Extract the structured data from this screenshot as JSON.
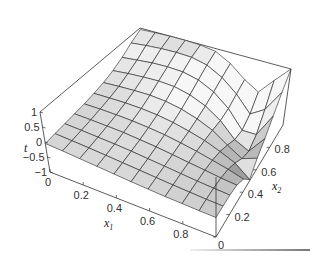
{
  "chart_data": {
    "type": "surface",
    "title": "",
    "xlabel": "x",
    "xlabel_sub": "1",
    "ylabel": "x",
    "ylabel_sub": "2",
    "zlabel": "t",
    "xlim": [
      0,
      1
    ],
    "ylim": [
      0,
      1
    ],
    "zlim": [
      -1,
      1
    ],
    "x_ticks": [
      "0",
      "0.2",
      "0.4",
      "0.6",
      "0.8"
    ],
    "x_tick_values": [
      0,
      0.2,
      0.4,
      0.6,
      0.8
    ],
    "y_ticks": [
      "0",
      "0.2",
      "0.4",
      "0.6",
      "0.8"
    ],
    "y_tick_values": [
      0,
      0.2,
      0.4,
      0.6,
      0.8
    ],
    "z_ticks": [
      "1",
      "0.5",
      "0",
      "−0.5",
      "−1"
    ],
    "z_tick_values": [
      1,
      0.5,
      0,
      -0.5,
      -1
    ],
    "grid_x": [
      0,
      0.1,
      0.2,
      0.3,
      0.4,
      0.5,
      0.6,
      0.7,
      0.8,
      0.9,
      1.0
    ],
    "grid_y": [
      0,
      0.1,
      0.2,
      0.3,
      0.4,
      0.5,
      0.6,
      0.7,
      0.8,
      0.9,
      1.0
    ],
    "z_values": [
      [
        -0.05,
        0.0,
        0.05,
        0.1,
        0.15,
        0.22,
        0.3,
        0.42,
        0.58,
        0.78,
        0.95
      ],
      [
        -0.08,
        -0.03,
        0.03,
        0.09,
        0.16,
        0.24,
        0.34,
        0.48,
        0.64,
        0.84,
        0.98
      ],
      [
        -0.12,
        -0.06,
        0.0,
        0.07,
        0.15,
        0.25,
        0.37,
        0.52,
        0.7,
        0.88,
        1.0
      ],
      [
        -0.16,
        -0.1,
        -0.03,
        0.05,
        0.13,
        0.24,
        0.38,
        0.55,
        0.72,
        0.9,
        1.0
      ],
      [
        -0.2,
        -0.14,
        -0.07,
        0.0,
        0.09,
        0.2,
        0.34,
        0.52,
        0.7,
        0.88,
        0.98
      ],
      [
        -0.24,
        -0.18,
        -0.12,
        -0.05,
        0.03,
        0.12,
        0.24,
        0.4,
        0.58,
        0.76,
        0.9
      ],
      [
        -0.27,
        -0.22,
        -0.17,
        -0.12,
        -0.06,
        0.0,
        0.08,
        0.18,
        0.32,
        0.48,
        0.62
      ],
      [
        -0.3,
        -0.26,
        -0.22,
        -0.19,
        -0.16,
        -0.14,
        -0.14,
        -0.16,
        -0.1,
        0.05,
        0.2
      ],
      [
        -0.32,
        -0.29,
        -0.27,
        -0.26,
        -0.28,
        -0.34,
        -0.48,
        -0.66,
        -0.7,
        -0.5,
        -0.1
      ],
      [
        -0.34,
        -0.32,
        -0.31,
        -0.33,
        -0.4,
        -0.56,
        -0.78,
        -0.9,
        -0.7,
        -0.2,
        0.45
      ],
      [
        -0.35,
        -0.34,
        -0.34,
        -0.38,
        -0.55,
        -0.95,
        -0.6,
        -0.3,
        0.1,
        0.55,
        1.0
      ]
    ],
    "z_values_layout": "rows indexed by x1 (grid_x), columns by x2 (grid_y)",
    "box": true,
    "grid": false,
    "legend": "none",
    "colors": {
      "surface_light": "#f4f4f4",
      "surface_dark": "#8a8a8a",
      "mesh": "#222222",
      "box": "#333333"
    }
  }
}
